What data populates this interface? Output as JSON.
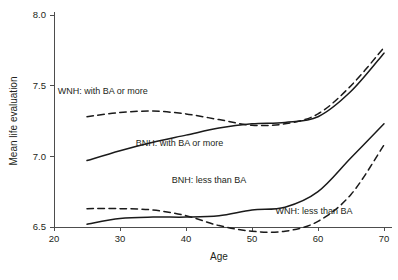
{
  "chart_data": {
    "type": "line",
    "title": "",
    "xlabel": "Age",
    "ylabel": "Mean life evaluation",
    "xlim": [
      20,
      70
    ],
    "ylim": [
      6.5,
      8.0
    ],
    "xticks": [
      20,
      30,
      40,
      50,
      60,
      70
    ],
    "xtick_labels": [
      "20",
      "30",
      "40",
      "50",
      "60",
      "70"
    ],
    "yticks": [
      6.5,
      7.0,
      7.5,
      8.0
    ],
    "ytick_labels": [
      "6.5",
      "7.0",
      "7.5",
      "8.0"
    ],
    "grid": false,
    "legend_position": "inline-annotations",
    "x": [
      25,
      30,
      35,
      40,
      45,
      50,
      55,
      60,
      65,
      70
    ],
    "series": [
      {
        "name": "WNH: with BA or more",
        "style": "dashed",
        "label": "WNH: with BA or more",
        "label_x": 27.4,
        "label_y": 7.44,
        "values": [
          7.28,
          7.31,
          7.32,
          7.3,
          7.26,
          7.22,
          7.23,
          7.3,
          7.5,
          7.77
        ]
      },
      {
        "name": "BNH: with BA or more",
        "style": "solid",
        "label": "BNH: with BA or more",
        "label_x": 39.0,
        "label_y": 7.07,
        "values": [
          6.97,
          7.04,
          7.1,
          7.15,
          7.2,
          7.23,
          7.24,
          7.28,
          7.46,
          7.73
        ]
      },
      {
        "name": "BNH: less than BA",
        "style": "solid",
        "label": "BNH: less than BA",
        "label_x": 43.5,
        "label_y": 6.81,
        "values": [
          6.52,
          6.56,
          6.57,
          6.57,
          6.58,
          6.62,
          6.64,
          6.75,
          6.99,
          7.23
        ]
      },
      {
        "name": "WNH: less than BA",
        "style": "dashed",
        "label": "WNH: less than BA",
        "label_x": 59.4,
        "label_y": 6.59,
        "values": [
          6.63,
          6.63,
          6.62,
          6.58,
          6.51,
          6.47,
          6.47,
          6.54,
          6.73,
          7.08
        ]
      }
    ],
    "colors": {
      "line": "#1a1a1a",
      "axis": "#4d4d4d",
      "text": "#231f20",
      "background": "#ffffff"
    }
  }
}
